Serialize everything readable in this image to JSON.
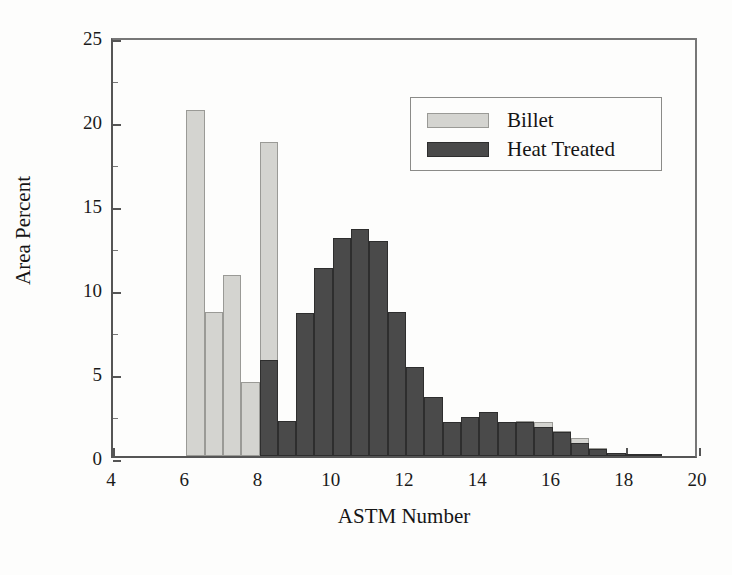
{
  "chart_data": {
    "type": "bar",
    "title": "",
    "xlabel": "ASTM Number",
    "ylabel": "Area Percent",
    "xlim": [
      4,
      20
    ],
    "ylim": [
      0,
      25
    ],
    "xticks": [
      4,
      6,
      8,
      10,
      12,
      14,
      16,
      18,
      20
    ],
    "yticks": [
      0,
      5,
      10,
      15,
      20,
      25
    ],
    "yticks_minor": [
      2.5,
      7.5,
      12.5,
      17.5,
      22.5
    ],
    "grid": false,
    "bar_width": 0.5,
    "legend_position": "upper right",
    "legend": [
      "Billet",
      "Heat Treated"
    ],
    "colors": {
      "billet_fill": "#d4d4d0",
      "billet_edge": "#9a9a96",
      "heat_fill": "#4a4a4a",
      "heat_edge": "#2e2e2e",
      "axis": "#555555",
      "background": "#fdfdfc",
      "text": "#151515"
    },
    "series": [
      {
        "name": "Billet",
        "x": [
          6.25,
          6.75,
          7.25,
          7.75,
          8.25,
          8.75,
          9.25,
          9.75,
          10.25,
          10.75,
          11.25,
          11.75,
          12.25,
          12.75,
          13.25,
          13.75,
          14.25,
          14.75,
          15.25,
          15.75,
          16.25,
          16.75,
          17.25,
          17.75,
          18.25
        ],
        "values": [
          20.6,
          8.6,
          10.8,
          4.4,
          18.7,
          0.0,
          0.0,
          6.4,
          4.4,
          2.4,
          1.7,
          1.2,
          0.5,
          0.6,
          1.1,
          2.2,
          2.0,
          2.0,
          2.1,
          2.0,
          1.5,
          1.1,
          0.5,
          0.2,
          0.1
        ]
      },
      {
        "name": "Heat Treated",
        "x": [
          8.25,
          8.75,
          9.25,
          9.75,
          10.25,
          10.75,
          11.25,
          11.75,
          12.25,
          12.75,
          13.25,
          13.75,
          14.25,
          14.75,
          15.25,
          15.75,
          16.25,
          16.75,
          17.25,
          17.75,
          18.25,
          18.75
        ],
        "values": [
          5.7,
          2.1,
          8.5,
          11.2,
          13.0,
          13.5,
          12.8,
          8.6,
          5.3,
          3.5,
          2.0,
          2.3,
          2.6,
          2.0,
          2.0,
          1.7,
          1.4,
          0.8,
          0.4,
          0.15,
          0.1,
          0.05
        ]
      }
    ]
  },
  "axes": {
    "ylabel": "Area Percent",
    "xlabel": "ASTM Number",
    "ytick_labels": [
      "0",
      "5",
      "10",
      "15",
      "20",
      "25"
    ],
    "xtick_labels": [
      "4",
      "6",
      "8",
      "10",
      "12",
      "14",
      "16",
      "18",
      "20"
    ]
  },
  "legend": {
    "items": [
      {
        "label": "Billet",
        "swatch": "billet"
      },
      {
        "label": "Heat Treated",
        "swatch": "heat"
      }
    ]
  }
}
